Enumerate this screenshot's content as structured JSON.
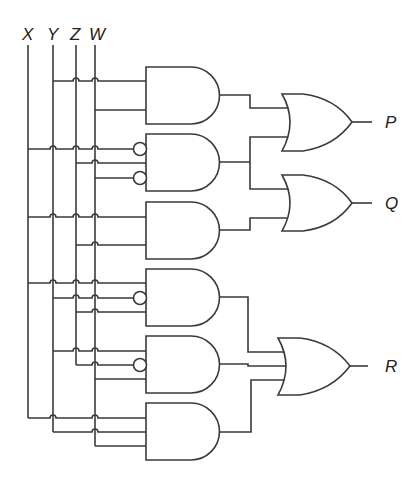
{
  "diagram": {
    "type": "logic-circuit",
    "inputs": [
      {
        "name": "X",
        "x": 28
      },
      {
        "name": "Y",
        "x": 53
      },
      {
        "name": "Z",
        "x": 76
      },
      {
        "name": "W",
        "x": 95
      }
    ],
    "outputs": [
      {
        "name": "P",
        "y": 122
      },
      {
        "name": "Q",
        "y": 203
      },
      {
        "name": "R",
        "y": 366
      }
    ],
    "and_gates": [
      {
        "id": "A1",
        "inputs": [
          "Y",
          "W"
        ],
        "inverted": []
      },
      {
        "id": "A2",
        "inputs": [
          "X",
          "Z",
          "W"
        ],
        "inverted": [
          "X",
          "W"
        ]
      },
      {
        "id": "A3",
        "inputs": [
          "X",
          "Z"
        ],
        "inverted": []
      },
      {
        "id": "A4",
        "inputs": [
          "X",
          "Y",
          "Z"
        ],
        "inverted": [
          "Y"
        ]
      },
      {
        "id": "A5",
        "inputs": [
          "Y",
          "Z",
          "W"
        ],
        "inverted": [
          "Z"
        ]
      },
      {
        "id": "A6",
        "inputs": [
          "X",
          "Y",
          "W"
        ],
        "inverted": []
      }
    ],
    "or_gates": [
      {
        "id": "P",
        "inputs": [
          "A1",
          "A2"
        ]
      },
      {
        "id": "Q",
        "inputs": [
          "A2",
          "A3"
        ]
      },
      {
        "id": "R",
        "inputs": [
          "A4",
          "A5",
          "A6"
        ]
      }
    ]
  },
  "labels": {
    "x": "X",
    "y": "Y",
    "z": "Z",
    "w": "W",
    "p": "P",
    "q": "Q",
    "r": "R"
  }
}
